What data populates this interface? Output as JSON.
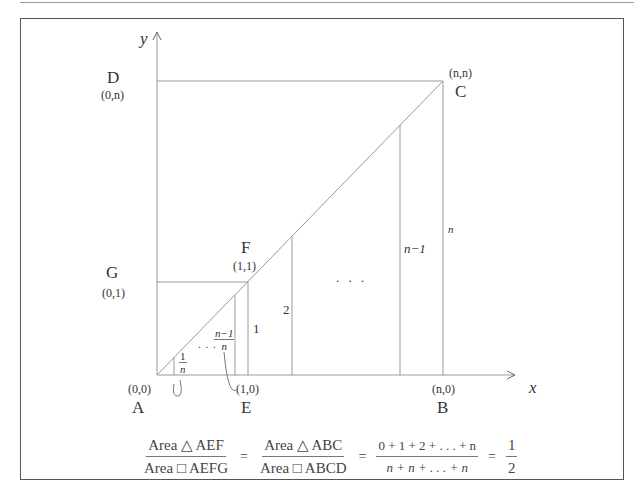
{
  "axes": {
    "x_label": "x",
    "y_label": "y"
  },
  "points": {
    "A": {
      "name": "A",
      "coord": "(0,0)"
    },
    "E": {
      "name": "E",
      "coord": "(1,0)"
    },
    "B": {
      "name": "B",
      "coord": "(n,0)"
    },
    "C": {
      "name": "C",
      "coord": "(n,n)"
    },
    "D": {
      "name": "D",
      "coord": "(0,n)"
    },
    "F": {
      "name": "F",
      "coord": "(1,1)"
    },
    "G": {
      "name": "G",
      "coord": "(0,1)"
    }
  },
  "heights": {
    "one_over_n_num": "1",
    "one_over_n_den": "n",
    "n_minus_1_over_n_num": "n−1",
    "n_minus_1_over_n_den": "n",
    "small_ellipsis": ". . .",
    "h1": "1",
    "h2": "2",
    "big_ellipsis": ". . .",
    "hn_minus_1": "n−1",
    "hn": "n"
  },
  "formula": {
    "f1_num": "Area △ AEF",
    "f1_den": "Area □ AEFG",
    "eq1": "=",
    "f2_num": "Area △ ABC",
    "f2_den": "Area □ ABCD",
    "eq2": "=",
    "f3_num": "0 + 1 + 2 + . . . + n",
    "f3_den": "n + n + . . . + n",
    "eq3": "=",
    "f4_num": "1",
    "f4_den": "2"
  },
  "colors": {
    "line": "#999999",
    "frame": "#555555",
    "text": "#333333"
  }
}
